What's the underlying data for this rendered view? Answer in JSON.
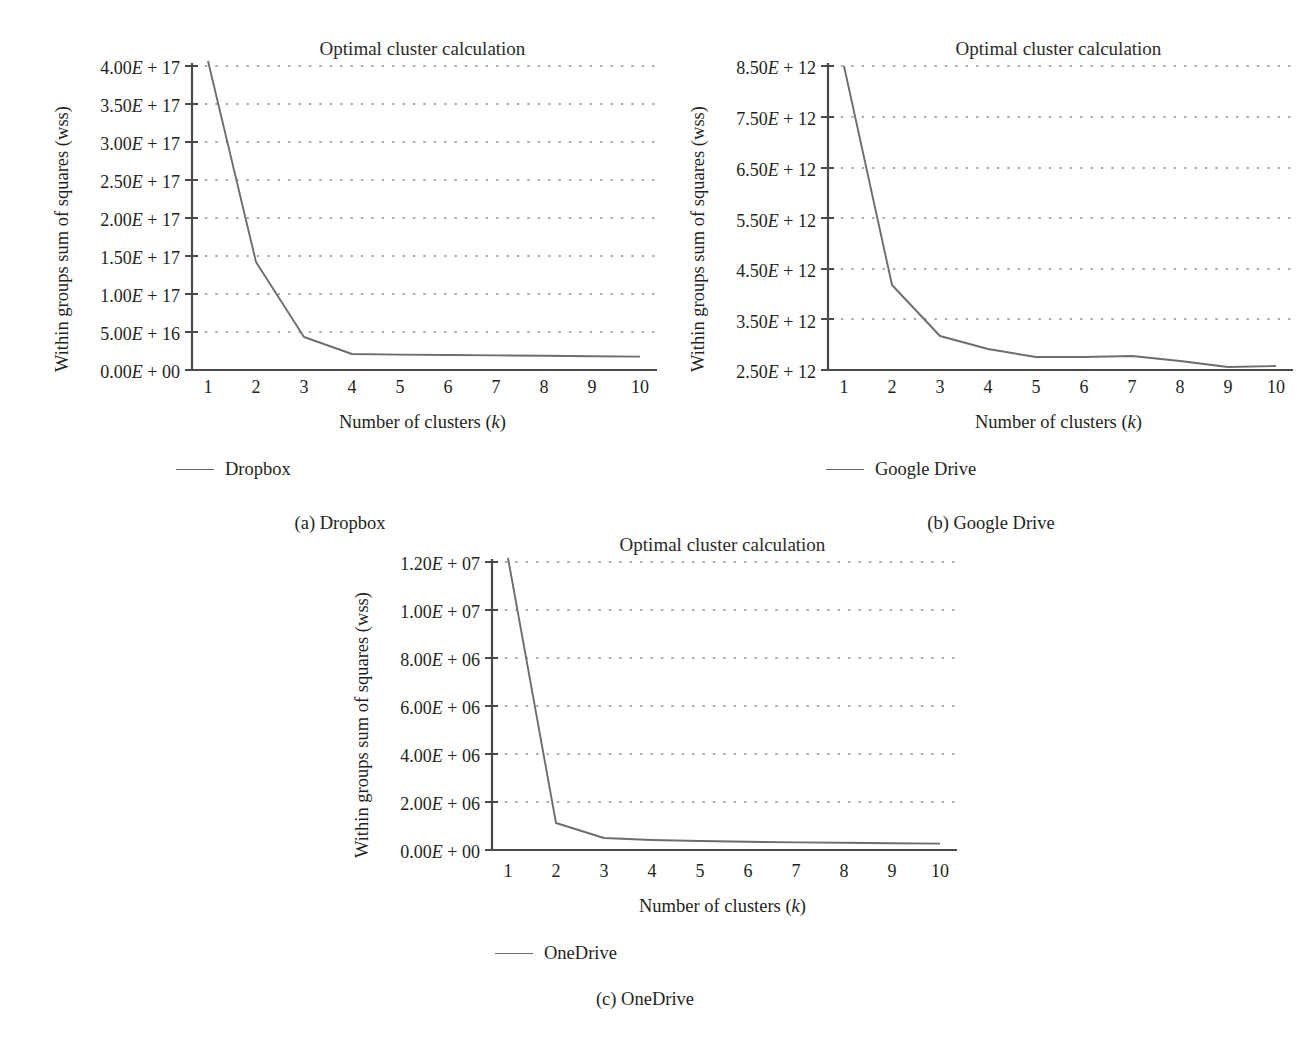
{
  "figure": {
    "panels": [
      {
        "id": "a",
        "caption": "(a)  Dropbox",
        "legend_label": "Dropbox",
        "chart_data": {
          "type": "line",
          "title": "Optimal cluster calculation",
          "xlabel": "Number of clusters (k)",
          "ylabel": "Within groups sum of squares (wss)",
          "x": [
            1,
            2,
            3,
            4,
            5,
            6,
            7,
            8,
            9,
            10
          ],
          "categories": [
            "1",
            "2",
            "3",
            "4",
            "5",
            "6",
            "7",
            "8",
            "9",
            "10"
          ],
          "series": [
            {
              "name": "Dropbox",
              "values": [
                4.15e+17,
                1.42e+17,
                4.3e+16,
                2e+16,
                1.95e+16,
                1.9e+16,
                1.85e+16,
                1.8e+16,
                1.78e+16,
                1.75e+16
              ]
            }
          ],
          "ylim": [
            0,
            400000000000000000
          ],
          "yticks": [
            0,
            5e+16,
            1e+17,
            1.5e+17,
            2e+17,
            2.5e+17,
            3e+17,
            3.5e+17,
            4e+17
          ],
          "ytick_labels": [
            "0.00E + 00",
            "5.00E + 16",
            "1.00E + 17",
            "1.50E + 17",
            "2.00E + 17",
            "2.50E + 17",
            "3.00E + 17",
            "3.50E + 17",
            "4.00E + 17"
          ],
          "xlim": [
            1,
            10
          ],
          "grid": "horizontal-dotted",
          "legend_position": "below-left"
        }
      },
      {
        "id": "b",
        "caption": "(b)  Google Drive",
        "legend_label": "Google Drive",
        "chart_data": {
          "type": "line",
          "title": "Optimal cluster calculation",
          "xlabel": "Number of clusters (k)",
          "ylabel": "Within groups sum of squares (wss)",
          "x": [
            1,
            2,
            3,
            4,
            5,
            6,
            7,
            8,
            9,
            10
          ],
          "categories": [
            "1",
            "2",
            "3",
            "4",
            "5",
            "6",
            "7",
            "8",
            "9",
            "10"
          ],
          "series": [
            {
              "name": "Google Drive",
              "values": [
                8500000000000.0,
                4200000000000.0,
                3200000000000.0,
                2950000000000.0,
                2800000000000.0,
                2800000000000.0,
                2820000000000.0,
                2720000000000.0,
                2600000000000.0,
                2600000000000.0
              ]
            }
          ],
          "ylim": [
            2500000000000,
            8500000000000
          ],
          "yticks": [
            2500000000000.0,
            3500000000000.0,
            4500000000000.0,
            5500000000000.0,
            6500000000000.0,
            7500000000000.0,
            8500000000000.0
          ],
          "ytick_labels": [
            "2.50E + 12",
            "3.50E + 12",
            "4.50E + 12",
            "5.50E + 12",
            "6.50E + 12",
            "7.50E + 12",
            "8.50E + 12"
          ],
          "xlim": [
            1,
            10
          ],
          "grid": "horizontal-dotted",
          "legend_position": "below-left"
        }
      },
      {
        "id": "c",
        "caption": "(c)  OneDrive",
        "legend_label": "OneDrive",
        "chart_data": {
          "type": "line",
          "title": "Optimal cluster calculation",
          "xlabel": "Number of clusters (k)",
          "ylabel": "Within groups sum of squares (wss)",
          "x": [
            1,
            2,
            3,
            4,
            5,
            6,
            7,
            8,
            9,
            10
          ],
          "categories": [
            "1",
            "2",
            "3",
            "4",
            "5",
            "6",
            "7",
            "8",
            "9",
            "10"
          ],
          "series": [
            {
              "name": "OneDrive",
              "values": [
                12150000.0,
                1100000.0,
                500000.0,
                440000.0,
                400000.0,
                380000.0,
                360000.0,
                350000.0,
                340000.0,
                330000.0
              ]
            }
          ],
          "ylim": [
            0,
            12000000
          ],
          "yticks": [
            0,
            2000000.0,
            4000000.0,
            6000000.0,
            8000000.0,
            10000000.0,
            12000000.0
          ],
          "ytick_labels": [
            "0.00E + 00",
            "2.00E + 06",
            "4.00E + 06",
            "6.00E + 06",
            "8.00E + 06",
            "1.00E + 07",
            "1.20E + 07"
          ],
          "xlim": [
            1,
            10
          ],
          "grid": "horizontal-dotted",
          "legend_position": "below-left"
        }
      }
    ],
    "colors": {
      "line": "#6d6d6d",
      "axis": "#4a4a4a",
      "grid_dot": "#8c8c8c",
      "text": "#231f20"
    },
    "axis_label_parts": {
      "x_prefix": "Number of clusters (",
      "x_italic": "k",
      "x_suffix": ")"
    }
  }
}
